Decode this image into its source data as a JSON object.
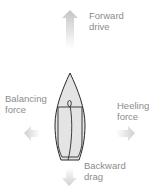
{
  "diagram": {
    "labels": {
      "forward": [
        "Forward",
        "drive"
      ],
      "balancing": [
        "Balancing",
        "force"
      ],
      "heeling": [
        "Heeling",
        "force"
      ],
      "backward": [
        "Backward",
        "drag"
      ]
    },
    "colors": {
      "hull_fill": "#e4e4e4",
      "outline": "#2a2a2a",
      "arrow": "#c8c8c8",
      "text": "#8c8c8c"
    }
  }
}
